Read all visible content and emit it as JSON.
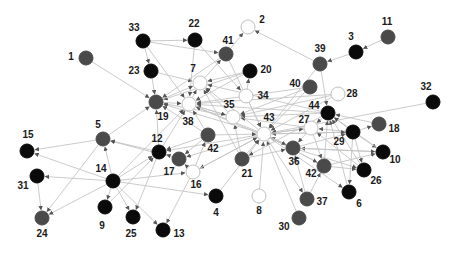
{
  "diagram": {
    "type": "directed-network-graph",
    "colors": {
      "black": "#0a0a0a",
      "gray": "#4a4a4a",
      "white": "#ffffff",
      "node_stroke": "#bfbfbf",
      "edge": "#c4c4c4",
      "label": "#1a1a1a"
    },
    "nodes": [
      {
        "id": "1",
        "x": 86,
        "y": 58,
        "fill": "gray",
        "lx": 71,
        "ly": 60
      },
      {
        "id": "2",
        "x": 248,
        "y": 27,
        "fill": "white",
        "lx": 262,
        "ly": 23
      },
      {
        "id": "3",
        "x": 356,
        "y": 52,
        "fill": "black",
        "lx": 351,
        "ly": 40
      },
      {
        "id": "11",
        "x": 388,
        "y": 37,
        "fill": "gray",
        "lx": 387,
        "ly": 25
      },
      {
        "id": "33",
        "x": 143,
        "y": 41,
        "fill": "black",
        "lx": 134,
        "ly": 31
      },
      {
        "id": "22",
        "x": 195,
        "y": 40,
        "fill": "black",
        "lx": 194,
        "ly": 27
      },
      {
        "id": "41",
        "x": 226,
        "y": 54,
        "fill": "gray",
        "lx": 228,
        "ly": 44
      },
      {
        "id": "39",
        "x": 320,
        "y": 64,
        "fill": "gray",
        "lx": 320,
        "ly": 52
      },
      {
        "id": "23",
        "x": 151,
        "y": 71,
        "fill": "black",
        "lx": 134,
        "ly": 74
      },
      {
        "id": "7",
        "x": 200,
        "y": 83,
        "fill": "white",
        "lx": 193,
        "ly": 72
      },
      {
        "id": "20",
        "x": 250,
        "y": 71,
        "fill": "black",
        "lx": 266,
        "ly": 73
      },
      {
        "id": "40",
        "x": 310,
        "y": 87,
        "fill": "gray",
        "lx": 295,
        "ly": 87
      },
      {
        "id": "28",
        "x": 338,
        "y": 94,
        "fill": "white",
        "lx": 352,
        "ly": 97
      },
      {
        "id": "32",
        "x": 433,
        "y": 102,
        "fill": "black",
        "lx": 426,
        "ly": 90
      },
      {
        "id": "19",
        "x": 156,
        "y": 102,
        "fill": "gray",
        "lx": 163,
        "ly": 120
      },
      {
        "id": "38",
        "x": 189,
        "y": 104,
        "fill": "white",
        "lx": 188,
        "ly": 125
      },
      {
        "id": "34",
        "x": 246,
        "y": 96,
        "fill": "white",
        "lx": 263,
        "ly": 99
      },
      {
        "id": "35",
        "x": 233,
        "y": 117,
        "fill": "white",
        "lx": 229,
        "ly": 108
      },
      {
        "id": "44",
        "x": 328,
        "y": 113,
        "fill": "black",
        "lx": 314,
        "ly": 109
      },
      {
        "id": "43",
        "x": 264,
        "y": 134,
        "fill": "white",
        "lx": 269,
        "ly": 121
      },
      {
        "id": "27",
        "x": 311,
        "y": 128,
        "fill": "white",
        "lx": 304,
        "ly": 123
      },
      {
        "id": "18",
        "x": 379,
        "y": 124,
        "fill": "gray",
        "lx": 394,
        "ly": 132
      },
      {
        "id": "29",
        "x": 353,
        "y": 132,
        "fill": "black",
        "lx": 339,
        "ly": 145
      },
      {
        "id": "5",
        "x": 103,
        "y": 139,
        "fill": "gray",
        "lx": 98,
        "ly": 128
      },
      {
        "id": "12",
        "x": 159,
        "y": 152,
        "fill": "black",
        "lx": 157,
        "ly": 142
      },
      {
        "id": "42",
        "x": 208,
        "y": 135,
        "fill": "gray",
        "lx": 213,
        "ly": 152
      },
      {
        "id": "17",
        "x": 179,
        "y": 159,
        "fill": "gray",
        "lx": 169,
        "ly": 175
      },
      {
        "id": "16",
        "x": 193,
        "y": 172,
        "fill": "white",
        "lx": 196,
        "ly": 188
      },
      {
        "id": "15",
        "x": 27,
        "y": 151,
        "fill": "black",
        "lx": 28,
        "ly": 138
      },
      {
        "id": "21",
        "x": 242,
        "y": 159,
        "fill": "gray",
        "lx": 247,
        "ly": 177
      },
      {
        "id": "36",
        "x": 293,
        "y": 148,
        "fill": "gray",
        "lx": 294,
        "ly": 165
      },
      {
        "id": "42b",
        "label": "42",
        "x": 324,
        "y": 166,
        "fill": "gray",
        "lx": 311,
        "ly": 177
      },
      {
        "id": "10",
        "x": 383,
        "y": 152,
        "fill": "black",
        "lx": 395,
        "ly": 163
      },
      {
        "id": "26",
        "x": 364,
        "y": 170,
        "fill": "black",
        "lx": 376,
        "ly": 184
      },
      {
        "id": "31",
        "x": 37,
        "y": 176,
        "fill": "black",
        "lx": 23,
        "ly": 189
      },
      {
        "id": "14",
        "x": 113,
        "y": 181,
        "fill": "black",
        "lx": 101,
        "ly": 172
      },
      {
        "id": "4",
        "x": 216,
        "y": 196,
        "fill": "black",
        "lx": 216,
        "ly": 216
      },
      {
        "id": "8",
        "x": 259,
        "y": 196,
        "fill": "white",
        "lx": 259,
        "ly": 214
      },
      {
        "id": "37",
        "x": 307,
        "y": 199,
        "fill": "gray",
        "lx": 322,
        "ly": 205
      },
      {
        "id": "6",
        "x": 349,
        "y": 192,
        "fill": "black",
        "lx": 359,
        "ly": 207
      },
      {
        "id": "9",
        "x": 105,
        "y": 207,
        "fill": "black",
        "lx": 102,
        "ly": 229
      },
      {
        "id": "25",
        "x": 133,
        "y": 217,
        "fill": "black",
        "lx": 131,
        "ly": 237
      },
      {
        "id": "24",
        "x": 42,
        "y": 218,
        "fill": "gray",
        "lx": 42,
        "ly": 237
      },
      {
        "id": "13",
        "x": 163,
        "y": 230,
        "fill": "black",
        "lx": 179,
        "ly": 237
      },
      {
        "id": "30",
        "x": 299,
        "y": 218,
        "fill": "gray",
        "lx": 284,
        "ly": 230
      }
    ],
    "edges": [
      [
        "3",
        "39"
      ],
      [
        "11",
        "3"
      ],
      [
        "39",
        "2"
      ],
      [
        "41",
        "2"
      ],
      [
        "33",
        "22"
      ],
      [
        "33",
        "41"
      ],
      [
        "33",
        "23"
      ],
      [
        "33",
        "38"
      ],
      [
        "1",
        "19"
      ],
      [
        "23",
        "19"
      ],
      [
        "23",
        "7"
      ],
      [
        "22",
        "38"
      ],
      [
        "22",
        "34"
      ],
      [
        "41",
        "19"
      ],
      [
        "41",
        "43"
      ],
      [
        "20",
        "19"
      ],
      [
        "20",
        "7"
      ],
      [
        "20",
        "38"
      ],
      [
        "34",
        "20"
      ],
      [
        "34",
        "43"
      ],
      [
        "35",
        "7"
      ],
      [
        "35",
        "19"
      ],
      [
        "35",
        "38"
      ],
      [
        "39",
        "43"
      ],
      [
        "39",
        "44"
      ],
      [
        "40",
        "35"
      ],
      [
        "40",
        "38"
      ],
      [
        "40",
        "43"
      ],
      [
        "28",
        "38"
      ],
      [
        "28",
        "43"
      ],
      [
        "28",
        "35"
      ],
      [
        "32",
        "43"
      ],
      [
        "44",
        "35"
      ],
      [
        "44",
        "27"
      ],
      [
        "44",
        "38"
      ],
      [
        "44",
        "7"
      ],
      [
        "27",
        "43"
      ],
      [
        "27",
        "35"
      ],
      [
        "29",
        "27"
      ],
      [
        "29",
        "43"
      ],
      [
        "29",
        "44"
      ],
      [
        "29",
        "18"
      ],
      [
        "29",
        "10"
      ],
      [
        "29",
        "26"
      ],
      [
        "29",
        "6"
      ],
      [
        "18",
        "44"
      ],
      [
        "10",
        "36"
      ],
      [
        "10",
        "44"
      ],
      [
        "26",
        "27"
      ],
      [
        "26",
        "44"
      ],
      [
        "42b",
        "44"
      ],
      [
        "42b",
        "43"
      ],
      [
        "42b",
        "26"
      ],
      [
        "42b",
        "10"
      ],
      [
        "36",
        "43"
      ],
      [
        "36",
        "38"
      ],
      [
        "36",
        "10"
      ],
      [
        "36",
        "26"
      ],
      [
        "36",
        "29"
      ],
      [
        "37",
        "36"
      ],
      [
        "37",
        "42b"
      ],
      [
        "6",
        "44"
      ],
      [
        "30",
        "43"
      ],
      [
        "8",
        "43"
      ],
      [
        "21",
        "43"
      ],
      [
        "21",
        "35"
      ],
      [
        "21",
        "7"
      ],
      [
        "21",
        "36"
      ],
      [
        "43",
        "42b"
      ],
      [
        "43",
        "37"
      ],
      [
        "43",
        "36"
      ],
      [
        "43",
        "6"
      ],
      [
        "43",
        "16"
      ],
      [
        "43",
        "17"
      ],
      [
        "43",
        "12"
      ],
      [
        "43",
        "19"
      ],
      [
        "43",
        "38"
      ],
      [
        "43",
        "7"
      ],
      [
        "43",
        "29"
      ],
      [
        "43",
        "27"
      ],
      [
        "42",
        "38"
      ],
      [
        "42",
        "19"
      ],
      [
        "42",
        "43"
      ],
      [
        "42",
        "17"
      ],
      [
        "42",
        "12"
      ],
      [
        "12",
        "5"
      ],
      [
        "12",
        "19"
      ],
      [
        "12",
        "38"
      ],
      [
        "12",
        "25"
      ],
      [
        "17",
        "5"
      ],
      [
        "17",
        "12"
      ],
      [
        "16",
        "17"
      ],
      [
        "16",
        "13"
      ],
      [
        "16",
        "42"
      ],
      [
        "16",
        "43"
      ],
      [
        "5",
        "15"
      ],
      [
        "5",
        "24"
      ],
      [
        "5",
        "19"
      ],
      [
        "14",
        "5"
      ],
      [
        "14",
        "15"
      ],
      [
        "14",
        "31"
      ],
      [
        "14",
        "24"
      ],
      [
        "14",
        "9"
      ],
      [
        "14",
        "25"
      ],
      [
        "14",
        "13"
      ],
      [
        "14",
        "4"
      ],
      [
        "14",
        "12"
      ],
      [
        "14",
        "38"
      ],
      [
        "14",
        "16"
      ],
      [
        "31",
        "24"
      ],
      [
        "4",
        "43"
      ],
      [
        "9",
        "12"
      ],
      [
        "19",
        "7"
      ],
      [
        "38",
        "7"
      ],
      [
        "7",
        "41"
      ],
      [
        "38",
        "35"
      ],
      [
        "19",
        "38"
      ],
      [
        "27",
        "36"
      ],
      [
        "44",
        "21"
      ],
      [
        "27",
        "42b"
      ]
    ]
  }
}
